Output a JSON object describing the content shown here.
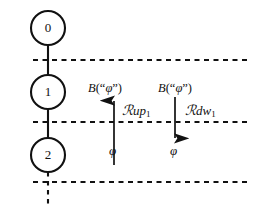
{
  "figure": {
    "type": "state-transition-diagram",
    "background_color": "#ffffff",
    "stroke_color": "#111111",
    "nodes": [
      {
        "id": "node-0",
        "label": "0",
        "cx": 48,
        "cy": 28,
        "r": 17
      },
      {
        "id": "node-1",
        "label": "1",
        "cx": 48,
        "cy": 92,
        "r": 17
      },
      {
        "id": "node-2",
        "label": "2",
        "cx": 48,
        "cy": 155,
        "r": 17
      }
    ],
    "horizontal_dashed_lines": [
      {
        "id": "boundary-top",
        "y": 60,
        "x1": 33,
        "x2": 250
      },
      {
        "id": "boundary-middle",
        "y": 122,
        "x1": 33,
        "x2": 250
      },
      {
        "id": "boundary-bottom",
        "y": 182,
        "x1": 33,
        "x2": 250
      }
    ],
    "vertical_dashed_segment": {
      "id": "trunk-dashed-tail",
      "x": 48,
      "y1": 172,
      "y2": 207
    },
    "arrows": [
      {
        "id": "arrow-up",
        "direction": "up",
        "x": 114,
        "y_tail": 165,
        "y_head": 97,
        "head_label": "B(“φ”)",
        "side_label": "ℛrup₁",
        "tail_label": "φ"
      },
      {
        "id": "arrow-down",
        "direction": "down",
        "x": 175,
        "y_tail": 97,
        "y_head": 142,
        "head_label": "B(“φ”)",
        "side_label": "ℛrdw₁",
        "tail_label": "φ"
      }
    ]
  },
  "labels": {
    "node_0": "0",
    "node_1": "1",
    "node_2": "2",
    "b_up": {
      "fn": "B",
      "open": "(",
      "quote_open": "“",
      "var": "φ",
      "quote_close": "”",
      "close": ")"
    },
    "b_down": {
      "fn": "B",
      "open": "(",
      "quote_open": "“",
      "var": "φ",
      "quote_close": "”",
      "close": ")"
    },
    "r_up": {
      "script": "ℛ",
      "word": "up",
      "sub": "1"
    },
    "r_down": {
      "script": "ℛ",
      "word": "dw",
      "sub": "1"
    },
    "phi_up": "φ",
    "phi_down": "φ"
  }
}
